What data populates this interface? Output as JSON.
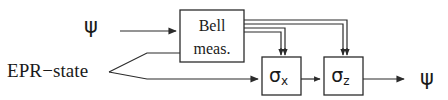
{
  "diagram": {
    "background_color": "#ffffff",
    "line_color": "#2b2b2b",
    "labels": {
      "input_psi": "ψ",
      "epr_state": "EPR−state",
      "output_psi": "ψ"
    },
    "boxes": [
      {
        "id": "bell-measurement-box",
        "line1": "Bell",
        "line2": "meas.",
        "x": 180,
        "y": 10,
        "w": 64,
        "h": 52
      },
      {
        "id": "sigma-x-box",
        "symbol": "σ",
        "subscript": "x",
        "x": 262,
        "y": 57,
        "w": 39,
        "h": 38
      },
      {
        "id": "sigma-z-box",
        "symbol": "σ",
        "subscript": "z",
        "x": 324,
        "y": 57,
        "w": 39,
        "h": 38
      }
    ],
    "connections": [
      {
        "id": "psi-into-bell",
        "kind": "single-arrow",
        "from": "input_psi",
        "to": "bell-measurement-box"
      },
      {
        "id": "epr-upper-into-bell",
        "kind": "single-line",
        "from": "epr_state",
        "to": "bell-measurement-box"
      },
      {
        "id": "epr-lower-into-sigma-x",
        "kind": "single-arrow",
        "from": "epr_state",
        "to": "sigma-x-box"
      },
      {
        "id": "bell-classical-to-sigma-x",
        "kind": "double-arrow",
        "from": "bell-measurement-box",
        "to": "sigma-x-box"
      },
      {
        "id": "bell-classical-to-sigma-z",
        "kind": "double-arrow",
        "from": "bell-measurement-box",
        "to": "sigma-z-box"
      },
      {
        "id": "sigma-x-to-sigma-z",
        "kind": "single-arrow",
        "from": "sigma-x-box",
        "to": "sigma-z-box"
      },
      {
        "id": "sigma-z-to-output",
        "kind": "single-arrow",
        "from": "sigma-z-box",
        "to": "output_psi"
      }
    ]
  }
}
